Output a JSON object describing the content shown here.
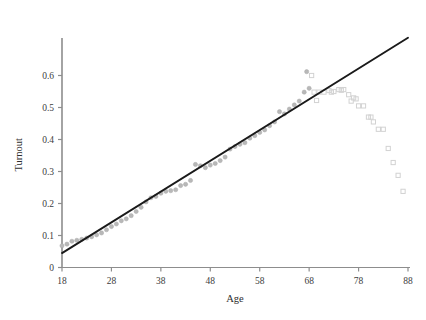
{
  "chart_data": {
    "type": "scatter",
    "title": "",
    "xlabel": "Age",
    "ylabel": "Turnout",
    "xlim": [
      18,
      88
    ],
    "ylim": [
      0,
      0.72
    ],
    "xticks": [
      18,
      28,
      38,
      48,
      58,
      68,
      78,
      88
    ],
    "yticks": [
      0,
      0.1,
      0.2,
      0.3,
      0.4,
      0.5,
      0.6
    ],
    "ytick_labels": [
      "0",
      "0.1",
      "0.2",
      "0.3",
      "0.4",
      "0.5",
      "0.6"
    ],
    "xtick_labels": [
      "18",
      "28",
      "38",
      "48",
      "58",
      "68",
      "78",
      "88"
    ],
    "grid": false,
    "legend": "none",
    "series": [
      {
        "name": "filled-points",
        "marker": "filled-circle",
        "color": "#b8b8b8",
        "points": [
          [
            18,
            0.068
          ],
          [
            19,
            0.073
          ],
          [
            20,
            0.082
          ],
          [
            21,
            0.085
          ],
          [
            22,
            0.088
          ],
          [
            23,
            0.092
          ],
          [
            24,
            0.096
          ],
          [
            25,
            0.102
          ],
          [
            26,
            0.108
          ],
          [
            27,
            0.118
          ],
          [
            28,
            0.128
          ],
          [
            29,
            0.136
          ],
          [
            30,
            0.146
          ],
          [
            31,
            0.152
          ],
          [
            32,
            0.162
          ],
          [
            33,
            0.175
          ],
          [
            34,
            0.188
          ],
          [
            35,
            0.205
          ],
          [
            36,
            0.218
          ],
          [
            37,
            0.222
          ],
          [
            38,
            0.232
          ],
          [
            39,
            0.238
          ],
          [
            40,
            0.24
          ],
          [
            41,
            0.243
          ],
          [
            42,
            0.256
          ],
          [
            43,
            0.26
          ],
          [
            44,
            0.272
          ],
          [
            45,
            0.322
          ],
          [
            46,
            0.318
          ],
          [
            47,
            0.312
          ],
          [
            48,
            0.32
          ],
          [
            49,
            0.325
          ],
          [
            50,
            0.334
          ],
          [
            51,
            0.345
          ],
          [
            52,
            0.37
          ],
          [
            53,
            0.378
          ],
          [
            54,
            0.385
          ],
          [
            55,
            0.39
          ],
          [
            56,
            0.404
          ],
          [
            57,
            0.412
          ],
          [
            58,
            0.422
          ],
          [
            59,
            0.43
          ],
          [
            60,
            0.443
          ],
          [
            61,
            0.455
          ],
          [
            62,
            0.487
          ],
          [
            63,
            0.48
          ],
          [
            64,
            0.495
          ],
          [
            65,
            0.508
          ],
          [
            66,
            0.52
          ],
          [
            67,
            0.548
          ],
          [
            67.5,
            0.612
          ],
          [
            68,
            0.56
          ]
        ]
      },
      {
        "name": "open-points",
        "marker": "open-square",
        "color": "#d2d2d2",
        "points": [
          [
            68.5,
            0.6
          ],
          [
            69,
            0.548
          ],
          [
            69.5,
            0.522
          ],
          [
            70,
            0.548
          ],
          [
            71,
            0.548
          ],
          [
            72,
            0.553
          ],
          [
            72.5,
            0.548
          ],
          [
            73,
            0.55
          ],
          [
            74,
            0.556
          ],
          [
            74.5,
            0.554
          ],
          [
            75,
            0.556
          ],
          [
            76,
            0.54
          ],
          [
            76.5,
            0.52
          ],
          [
            77,
            0.53
          ],
          [
            77.5,
            0.527
          ],
          [
            78,
            0.505
          ],
          [
            79,
            0.505
          ],
          [
            80,
            0.47
          ],
          [
            80.5,
            0.47
          ],
          [
            81,
            0.455
          ],
          [
            82,
            0.432
          ],
          [
            83,
            0.432
          ],
          [
            84,
            0.372
          ],
          [
            85,
            0.328
          ],
          [
            86,
            0.288
          ],
          [
            87,
            0.238
          ]
        ]
      }
    ],
    "fit_line": {
      "name": "regression-line",
      "color": "#1a1a1a",
      "x1": 18,
      "y1": 0.045,
      "x2": 88,
      "y2": 0.718
    }
  }
}
